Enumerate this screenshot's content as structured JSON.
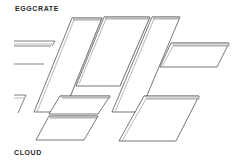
{
  "labels": {
    "top": "EGGCRATE",
    "bottom": "CLOUD"
  },
  "colors": {
    "background": "#ffffff",
    "line": "#3d3d3d",
    "text": "#2a2a2a"
  },
  "figure": {
    "type": "line-art illustration",
    "elements": [
      "eggcrate-ceiling-baffles",
      "cloud-ceiling-panels"
    ]
  }
}
